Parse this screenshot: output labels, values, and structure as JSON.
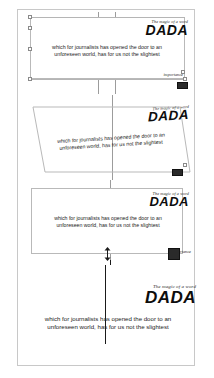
{
  "document": {
    "kicker": "The magic of a word",
    "headline": "DADA",
    "body_line1": "which for journalists has opened the door to an",
    "body_line2": "unforeseen world, has for us not the slightest",
    "trailing_word": "importance"
  },
  "panels": [
    {
      "id": "panel-1",
      "state": "selected",
      "description": "Text frame selected with handles and guides"
    },
    {
      "id": "panel-2",
      "state": "skewed",
      "description": "Text frame skewed into a parallelogram"
    },
    {
      "id": "panel-3",
      "state": "resizing",
      "description": "Text frame with vertical resize cursor"
    },
    {
      "id": "panel-4",
      "state": "final",
      "description": "Final enlarged text with vertical guide"
    }
  ],
  "colors": {
    "guide": "#9c9c9c",
    "guide_dark": "#1a1a1a",
    "frame": "#b9b9b9",
    "outer_frame": "#c8c8c8",
    "cursor_block": "#2a2a2a",
    "text": "#232323",
    "headline": "#0d0d0d",
    "background": "#ffffff"
  }
}
